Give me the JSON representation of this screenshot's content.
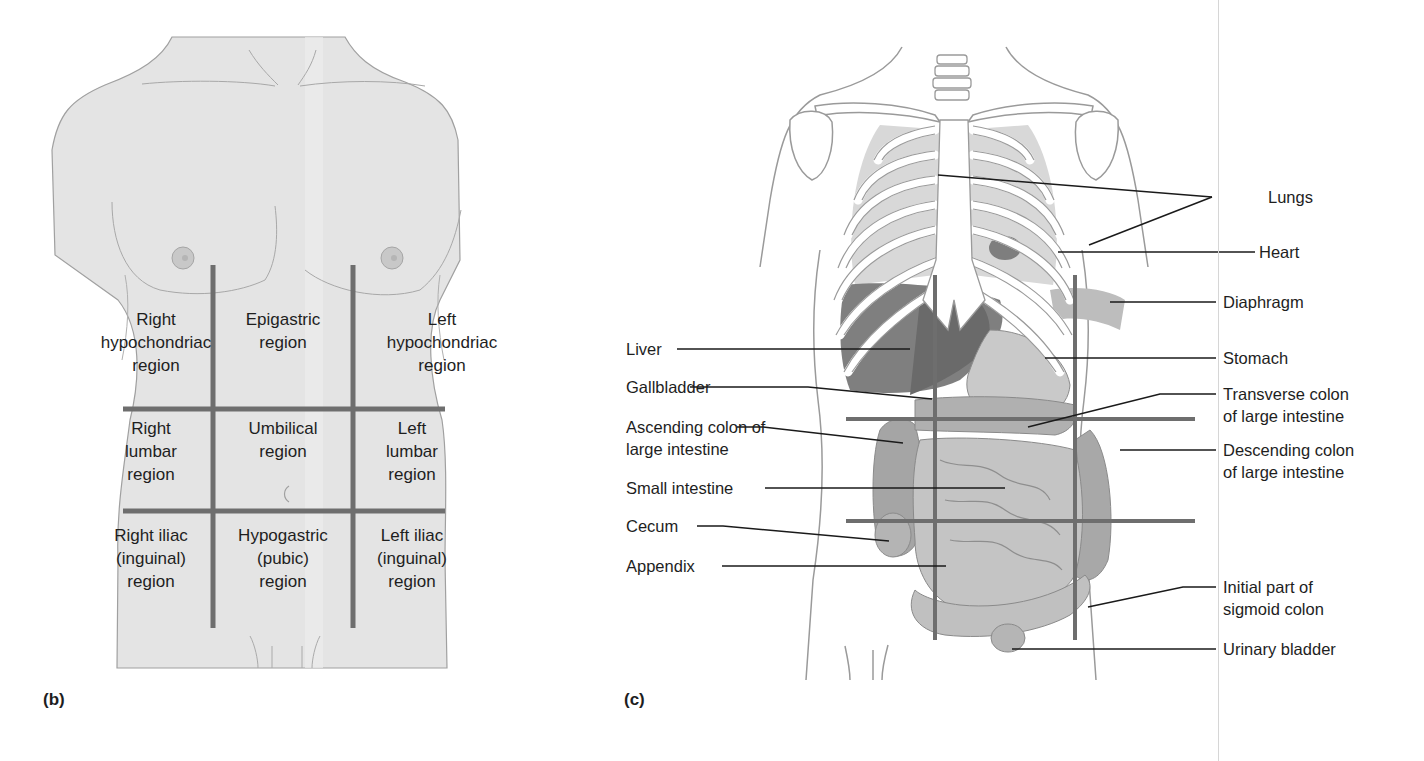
{
  "figure": {
    "panels": [
      {
        "tag": "(b)",
        "title": "Nine abdominopelvic regions (surface view)",
        "regions": [
          {
            "row": 0,
            "col": 0,
            "lines": [
              "Right",
              "hypochondriac",
              "region"
            ]
          },
          {
            "row": 0,
            "col": 1,
            "lines": [
              "Epigastric",
              "region"
            ]
          },
          {
            "row": 0,
            "col": 2,
            "lines": [
              "Left",
              "hypochondriac",
              "region"
            ]
          },
          {
            "row": 1,
            "col": 0,
            "lines": [
              "Right",
              "lumbar",
              "region"
            ]
          },
          {
            "row": 1,
            "col": 1,
            "lines": [
              "Umbilical",
              "region"
            ]
          },
          {
            "row": 1,
            "col": 2,
            "lines": [
              "Left",
              "lumbar",
              "region"
            ]
          },
          {
            "row": 2,
            "col": 0,
            "lines": [
              "Right iliac",
              "(inguinal)",
              "region"
            ]
          },
          {
            "row": 2,
            "col": 1,
            "lines": [
              "Hypogastric",
              "(pubic)",
              "region"
            ]
          },
          {
            "row": 2,
            "col": 2,
            "lines": [
              "Left iliac",
              "(inguinal)",
              "region"
            ]
          }
        ]
      },
      {
        "tag": "(c)",
        "title": "Organs within the abdominopelvic regions",
        "left_labels": [
          {
            "lines": [
              "Liver"
            ]
          },
          {
            "lines": [
              "Gallbladder"
            ]
          },
          {
            "lines": [
              "Ascending colon of",
              "large intestine"
            ]
          },
          {
            "lines": [
              "Small intestine"
            ]
          },
          {
            "lines": [
              "Cecum"
            ]
          },
          {
            "lines": [
              "Appendix"
            ]
          }
        ],
        "right_labels": [
          {
            "lines": [
              "Lungs"
            ]
          },
          {
            "lines": [
              "Heart"
            ]
          },
          {
            "lines": [
              "Diaphragm"
            ]
          },
          {
            "lines": [
              "Stomach"
            ]
          },
          {
            "lines": [
              "Transverse colon",
              "of large intestine"
            ]
          },
          {
            "lines": [
              "Descending colon",
              "of large intestine"
            ]
          },
          {
            "lines": [
              "Initial part of",
              "sigmoid colon"
            ]
          },
          {
            "lines": [
              "Urinary bladder"
            ]
          }
        ]
      }
    ],
    "colors": {
      "skin": "#e3e3e3",
      "outline": "#9a9a9a",
      "grid_lines": "#6e6e6e",
      "leader_lines": "#1a1a1a",
      "organ_dark": "#7a7a7a",
      "organ_mid": "#a8a8a8",
      "organ_light": "#cfcfcf",
      "bone": "#ffffff"
    }
  }
}
